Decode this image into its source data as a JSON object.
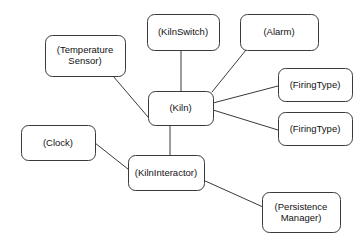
{
  "diagram": {
    "kind": "uml-object-collaboration-diagram",
    "canvas": {
      "width": 361,
      "height": 242
    },
    "style": {
      "background_color": "#ffffff",
      "node_fill_color": "#ffffff",
      "node_border_color": "#3a3a3a",
      "edge_color": "#3a3a3a",
      "text_color": "#111111",
      "corner_radius": 7,
      "border_width": 1,
      "font_size": 9.5,
      "line_height": 11
    },
    "nodes": [
      {
        "id": "temperature-sensor",
        "name": "temperature-sensor-node",
        "lines": [
          "(Temperature",
          "Sensor)"
        ],
        "label": "(Temperature Sensor)",
        "x": 45,
        "y": 35,
        "w": 80,
        "h": 41
      },
      {
        "id": "kiln-switch",
        "name": "kiln-switch-node",
        "lines": [
          "(KilnSwitch)"
        ],
        "label": "(KilnSwitch)",
        "x": 147,
        "y": 14,
        "w": 72,
        "h": 36
      },
      {
        "id": "alarm",
        "name": "alarm-node",
        "lines": [
          "(Alarm)"
        ],
        "label": "(Alarm)",
        "x": 240,
        "y": 14,
        "w": 78,
        "h": 36
      },
      {
        "id": "firing-type-1",
        "name": "firing-type-node-1",
        "lines": [
          "(FiringType)"
        ],
        "label": "(FiringType)",
        "x": 278,
        "y": 68,
        "w": 74,
        "h": 33
      },
      {
        "id": "firing-type-2",
        "name": "firing-type-node-2",
        "lines": [
          "(FiringType)"
        ],
        "label": "(FiringType)",
        "x": 278,
        "y": 112,
        "w": 74,
        "h": 33
      },
      {
        "id": "kiln",
        "name": "kiln-node",
        "lines": [
          "(Kiln)"
        ],
        "label": "(Kiln)",
        "x": 148,
        "y": 91,
        "w": 65,
        "h": 34
      },
      {
        "id": "clock",
        "name": "clock-node",
        "lines": [
          "(Clock)"
        ],
        "label": "(Clock)",
        "x": 21,
        "y": 125,
        "w": 74,
        "h": 35
      },
      {
        "id": "kiln-interactor",
        "name": "kiln-interactor-node",
        "lines": [
          "(KilnInteractor)"
        ],
        "label": "(KilnInteractor)",
        "x": 128,
        "y": 155,
        "w": 76,
        "h": 35
      },
      {
        "id": "persistence-manager",
        "name": "persistence-manager-node",
        "lines": [
          "(Persistence",
          "Manager)"
        ],
        "label": "(Persistence Manager)",
        "x": 262,
        "y": 192,
        "w": 78,
        "h": 40
      }
    ],
    "edges": [
      {
        "id": "edge-kiln-kilnswitch",
        "name": "edge-kiln-to-kiln-switch",
        "from": "kiln",
        "to": "kiln-switch",
        "x1": 181,
        "y1": 91,
        "x2": 181,
        "y2": 50
      },
      {
        "id": "edge-kiln-temperaturesensor",
        "name": "edge-kiln-to-temperature-sensor",
        "from": "kiln",
        "to": "temperature-sensor",
        "x1": 148,
        "y1": 117,
        "x2": 113,
        "y2": 76
      },
      {
        "id": "edge-kiln-alarm",
        "name": "edge-kiln-to-alarm",
        "from": "kiln",
        "to": "alarm",
        "x1": 212,
        "y1": 92,
        "x2": 246,
        "y2": 50
      },
      {
        "id": "edge-kiln-firingtype1",
        "name": "edge-kiln-to-firing-type-1",
        "from": "kiln",
        "to": "firing-type-1",
        "x1": 213,
        "y1": 103,
        "x2": 278,
        "y2": 86
      },
      {
        "id": "edge-kiln-firingtype2",
        "name": "edge-kiln-to-firing-type-2",
        "from": "kiln",
        "to": "firing-type-2",
        "x1": 213,
        "y1": 110,
        "x2": 278,
        "y2": 130
      },
      {
        "id": "edge-kiln-kilninteractor",
        "name": "edge-kiln-to-kiln-interactor",
        "from": "kiln",
        "to": "kiln-interactor",
        "x1": 170,
        "y1": 125,
        "x2": 170,
        "y2": 155
      },
      {
        "id": "edge-clock-kilninteractor",
        "name": "edge-clock-to-kiln-interactor",
        "from": "clock",
        "to": "kiln-interactor",
        "x1": 95,
        "y1": 143,
        "x2": 133,
        "y2": 173
      },
      {
        "id": "edge-kilninteractor-persistencemanager",
        "name": "edge-kiln-interactor-to-persistence-manager",
        "from": "kiln-interactor",
        "to": "persistence-manager",
        "x1": 203,
        "y1": 180,
        "x2": 263,
        "y2": 207
      }
    ]
  }
}
